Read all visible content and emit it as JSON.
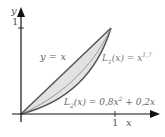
{
  "diagram": {
    "axes": {
      "x_label": "x",
      "y_label": "y",
      "x_tick": "1",
      "y_tick": "1"
    },
    "curves": [
      {
        "name": "line-of-equality",
        "label": "y = x"
      },
      {
        "name": "lorenz-1",
        "label_prefix": "L",
        "label_sub": "1",
        "label_mid": "(x) = x",
        "label_sup": "1,7"
      },
      {
        "name": "lorenz-2",
        "label_prefix": "L",
        "label_sub": "2",
        "label_mid": "(x) = 0,8x",
        "label_sup": "2",
        "label_tail": " + 0,2x"
      }
    ],
    "colors": {
      "axis": "#111111",
      "curve": "#555555",
      "fill": "#e2e2e2",
      "text": "#666666"
    }
  }
}
